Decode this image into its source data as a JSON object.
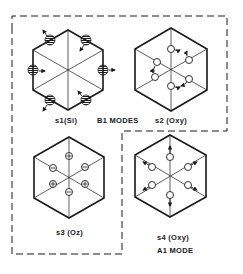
{
  "figure": {
    "group_label": "B1 MODES",
    "panels": [
      {
        "id": "s1",
        "symbol": "s1",
        "species": "(Si)",
        "center": [
          68,
          70
        ],
        "radius": 41,
        "atom_style": "hatched",
        "displacement": "tangential-alternating"
      },
      {
        "id": "s2",
        "symbol": "s2",
        "species": "(Oxy)",
        "center": [
          171,
          69
        ],
        "radius": 41,
        "atom_style": "open",
        "displacement": "tangential-alternating"
      },
      {
        "id": "s3",
        "symbol": "s3",
        "species": "(Oz)",
        "center": [
          69,
          177
        ],
        "radius": 41,
        "atom_style": "plus-minus",
        "displacement": "out-of-plane"
      },
      {
        "id": "s4",
        "symbol": "s4",
        "species": "(Oxy)",
        "center": [
          170,
          176
        ],
        "radius": 41,
        "atom_style": "open",
        "displacement": "radial-outward"
      }
    ],
    "labels": {
      "s1": "s1(Si)",
      "b1_modes": "B1  MODES",
      "s2": "s2 (Oxy)",
      "s3": "s3 (Oz)",
      "s4": "s4 (Oxy)",
      "a1_mode": "A1  MODE"
    },
    "colors": {
      "line": "#1a1a1a",
      "background": "#ffffff"
    }
  }
}
